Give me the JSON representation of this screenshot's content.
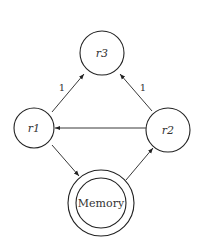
{
  "diagram": {
    "nodes": [
      {
        "id": "r3",
        "label": "r3",
        "cx": 102,
        "cy": 53,
        "r": 22,
        "italic": true
      },
      {
        "id": "r1",
        "label": "r1",
        "cx": 34,
        "cy": 128,
        "r": 20,
        "italic": true
      },
      {
        "id": "r2",
        "label": "r2",
        "cx": 168,
        "cy": 130,
        "r": 22,
        "italic": true
      },
      {
        "id": "memory",
        "label": "Memory",
        "cx": 101,
        "cy": 203,
        "r": 33,
        "inner_r": 25,
        "italic": false
      }
    ],
    "edges": [
      {
        "from": "r1",
        "to": "r3",
        "label": "1"
      },
      {
        "from": "r2",
        "to": "r3",
        "label": "1"
      },
      {
        "from": "r2",
        "to": "r1",
        "label": ""
      },
      {
        "from": "r1",
        "to": "memory",
        "label": ""
      },
      {
        "from": "memory",
        "to": "r2",
        "label": ""
      }
    ],
    "edge_labels": {
      "r1_r3": "1",
      "r2_r3": "1"
    }
  }
}
